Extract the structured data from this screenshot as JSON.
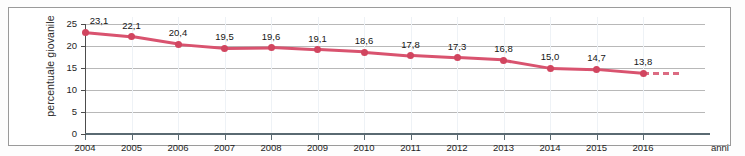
{
  "chart_data": {
    "type": "line",
    "title": "",
    "xlabel": "anni",
    "ylabel": "percentuale giovanile",
    "categories": [
      "2004",
      "2005",
      "2006",
      "2007",
      "2008",
      "2009",
      "2010",
      "2011",
      "2012",
      "2013",
      "2014",
      "2015",
      "2016"
    ],
    "values": [
      23.1,
      22.1,
      20.4,
      19.5,
      19.6,
      19.1,
      18.6,
      17.8,
      17.3,
      16.8,
      15.0,
      14.7,
      13.8
    ],
    "point_labels": [
      "23,1",
      "22,1",
      "20,4",
      "19,5",
      "19,6",
      "19,1",
      "18,6",
      "17,8",
      "17,3",
      "16,8",
      "15,0",
      "14,7",
      "13,8"
    ],
    "yticks": [
      0,
      5,
      10,
      15,
      20,
      25
    ],
    "ytick_labels": [
      "0",
      "5",
      "10",
      "15",
      "20",
      "25"
    ],
    "ylim": [
      0,
      25
    ],
    "xlim": [
      "2004",
      "2016"
    ],
    "grid": "horizontal",
    "legend": "none",
    "series_color": "#d9536f",
    "marker_color": "#d1455f",
    "gridline_color": "#b8b8b8",
    "axis_color": "#5a6a72",
    "projection": {
      "style": "dashed",
      "from_category": "2016",
      "note": "dashed trend continuation beyond 2016"
    }
  }
}
